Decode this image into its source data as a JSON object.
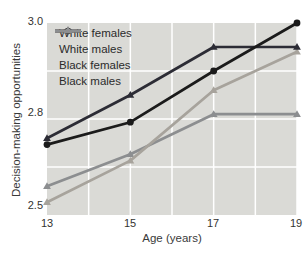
{
  "colors": {
    "plot_bg": "#dadad6",
    "grid": "#ffffff",
    "tick_text": "#333330",
    "axis_label_text": "#3a3a3a"
  },
  "chart_data": {
    "type": "line",
    "title": "",
    "xlabel": "Age (years)",
    "ylabel": "Decision-making opportunities",
    "x": [
      13,
      15,
      17,
      19
    ],
    "x_ticks": [
      "13",
      "15",
      "17",
      "19"
    ],
    "y_ticks": [
      "3.0",
      "2.8",
      "2.5"
    ],
    "y_scale": {
      "top": 3.0,
      "mid": 2.8,
      "bottom": 2.5,
      "note": "nonlinear axis: 2.8 label sits at vertical midpoint between 2.5 and 3.0"
    },
    "grid": "white gridlines at every year (x) and quarter heights (y)",
    "legend_position": "top-left inside plot",
    "series": [
      {
        "name": "White females",
        "color": "#1b1b1b",
        "marker": "circle",
        "values": [
          2.72,
          2.79,
          2.9,
          3.0
        ]
      },
      {
        "name": "White males",
        "color": "#2c2c35",
        "marker": "triangle",
        "values": [
          2.74,
          2.85,
          2.95,
          2.95
        ]
      },
      {
        "name": "Black females",
        "color": "#a7a39c",
        "marker": "triangle",
        "values": [
          2.54,
          2.67,
          2.86,
          2.94
        ]
      },
      {
        "name": "Black males",
        "color": "#8c8e90",
        "marker": "triangle",
        "values": [
          2.59,
          2.69,
          2.81,
          2.81
        ]
      }
    ]
  }
}
